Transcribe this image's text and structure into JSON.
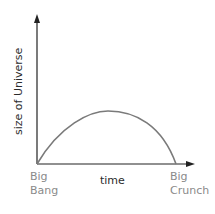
{
  "diagram": {
    "y_axis_label": "size of Universe",
    "x_axis_label": "time",
    "start_label": {
      "line1": "Big",
      "line2": "Bang"
    },
    "end_label": {
      "line1": "Big",
      "line2": "Crunch"
    },
    "colors": {
      "axis": "#222222",
      "curve": "#7a7a7a",
      "axis_text": "#2b2b2b",
      "event_text": "#8a8a8a"
    }
  }
}
